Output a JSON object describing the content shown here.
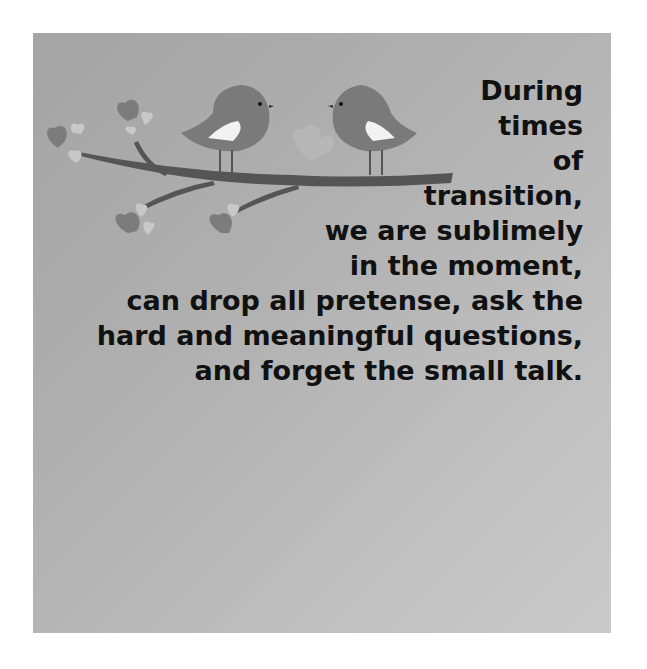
{
  "quote": {
    "lines": [
      "During",
      "times",
      "of",
      "transition,",
      "we are sublimely",
      "in the moment,",
      "can drop all pretense, ask the",
      "hard and meaningful questions,",
      "and forget the small talk."
    ]
  },
  "illustration": {
    "subject": "two birds on a branch with hearts",
    "colors": {
      "background": "#b0b0b0",
      "bird": "#7a7a7a",
      "wing": "#f2f2f2",
      "branch": "#555555",
      "heart_dark": "#7c7c7c",
      "heart_light": "#c8c8c8",
      "text": "#111111"
    }
  }
}
